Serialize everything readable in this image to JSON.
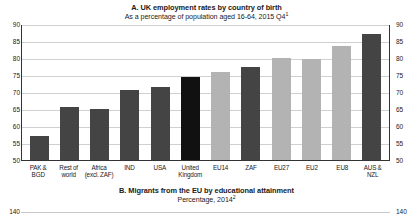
{
  "panel_a": {
    "title_prefix": "A. UK employment rates by country of birth",
    "subtitle_text": "As a percentage of population aged 16-64, 2015 Q4",
    "subtitle_footnote": "1"
  },
  "panel_b": {
    "title_prefix": "B. Migrants from the EU by educational attainment",
    "subtitle_text": "Percentage, 2014",
    "subtitle_footnote": "2",
    "axis_left_label": "140",
    "axis_right_label": "140"
  },
  "colors": {
    "bar_default": "#444444",
    "bar_highlight": "#111111",
    "bar_light": "#b3b3b3",
    "gridline": "#d0d0d0",
    "axis": "#333333"
  },
  "chart_data": {
    "type": "bar",
    "title": "A. UK employment rates by country of birth",
    "subtitle": "As a percentage of population aged 16-64, 2015 Q4",
    "xlabel": "",
    "ylabel": "",
    "ylim": [
      50,
      90
    ],
    "yticks": [
      50,
      55,
      60,
      65,
      70,
      75,
      80,
      85,
      90
    ],
    "ytick_labels": [
      "50",
      "55",
      "60",
      "65",
      "70",
      "75",
      "80",
      "85",
      "90"
    ],
    "grid": true,
    "legend": "none",
    "dual_axis": true,
    "categories": [
      "PAK & BGD",
      "Rest of world",
      "Africa (excl. ZAF)",
      "IND",
      "USA",
      "United Kingdom",
      "EU14",
      "ZAF",
      "EU27",
      "EU2",
      "EU8",
      "AUS & NZL"
    ],
    "category_lines": [
      [
        "PAK &",
        "BGD"
      ],
      [
        "Rest of",
        "world"
      ],
      [
        "Africa",
        "(excl. ZAF)"
      ],
      [
        "IND",
        ""
      ],
      [
        "USA",
        ""
      ],
      [
        "United",
        "Kingdom"
      ],
      [
        "EU14",
        ""
      ],
      [
        "ZAF",
        ""
      ],
      [
        "EU27",
        ""
      ],
      [
        "EU2",
        ""
      ],
      [
        "EU8",
        ""
      ],
      [
        "AUS &",
        "NZL"
      ]
    ],
    "values": [
      57.0,
      65.5,
      65.0,
      70.5,
      71.5,
      74.5,
      76.0,
      77.5,
      80.0,
      79.8,
      83.5,
      87.0
    ],
    "bar_styles": [
      "default",
      "default",
      "default",
      "default",
      "default",
      "highlight",
      "light",
      "default",
      "light",
      "light",
      "light",
      "default"
    ]
  }
}
